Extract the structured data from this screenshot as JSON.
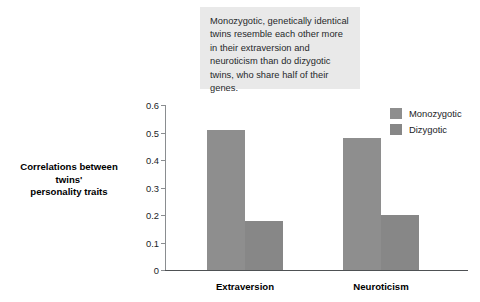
{
  "annotation": {
    "text": "Monozygotic, genetically identical twins resemble each other more in their extraversion and neuroticism than do dizygotic twins, who share half of their genes.",
    "background_color": "#e9e9e9"
  },
  "axis_title": {
    "line1": "Correlations between",
    "line2": "twins'",
    "line3": "personality traits"
  },
  "legend": {
    "items": [
      {
        "label": "Monozygotic",
        "color": "#8e8e8e"
      },
      {
        "label": "Dizygotic",
        "color": "#878787"
      }
    ]
  },
  "chart_data": {
    "type": "bar",
    "title": "",
    "xlabel": "",
    "ylabel": "Correlations between twins' personality traits",
    "categories": [
      "Extraversion",
      "Neuroticism"
    ],
    "series": [
      {
        "name": "Monozygotic",
        "color": "#8e8e8e",
        "values": [
          0.51,
          0.48
        ]
      },
      {
        "name": "Dizygotic",
        "color": "#878787",
        "values": [
          0.18,
          0.2
        ]
      }
    ],
    "ylim": [
      0,
      0.6
    ],
    "ytick_values": [
      0,
      0.1,
      0.2,
      0.3,
      0.4,
      0.5,
      0.6
    ],
    "ytick_labels": [
      "0",
      "0.1",
      "0.2",
      "0.3",
      "0.4",
      "0.5",
      "0.6"
    ],
    "grid": false,
    "legend_position": "top-right"
  }
}
